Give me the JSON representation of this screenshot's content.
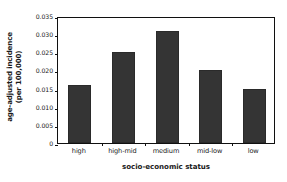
{
  "chart_data": {
    "type": "bar",
    "title": "",
    "categories": [
      "high",
      "high-mid",
      "medium",
      "mid-low",
      "low"
    ],
    "values": [
      0.016,
      0.025,
      0.031,
      0.02,
      0.0148
    ],
    "series": [
      {
        "name": "age-adjusted incidence (per 100,000)",
        "values": [
          0.016,
          0.025,
          0.031,
          0.02,
          0.0148
        ]
      }
    ],
    "xlabel": "socio-economic status",
    "ylabel_line1": "age-adjusted incidence",
    "ylabel_line2": "(per 100,000)",
    "ylabel": "age-adjusted incidence (per 100,000)",
    "ylim": [
      0,
      0.035
    ],
    "ytick_values": [
      0,
      0.005,
      0.01,
      0.015,
      0.02,
      0.025,
      0.03,
      0.035
    ],
    "ytick_labels": [
      "0",
      "0.005",
      "0.010",
      "0.015",
      "0.020",
      "0.025",
      "0.030",
      "0.035"
    ],
    "grid": false,
    "legend": false,
    "legend_position": "none",
    "bar_color": "#343434",
    "axis_color": "#101010",
    "background_color": "#ffffff"
  }
}
